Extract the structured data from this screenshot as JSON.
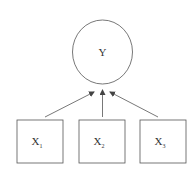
{
  "diagram": {
    "type": "path-diagram",
    "outcome": {
      "id": "Y",
      "label": "Y",
      "shape": "circle"
    },
    "predictors": [
      {
        "id": "X1",
        "label": "X",
        "subscript": "1",
        "shape": "square"
      },
      {
        "id": "X2",
        "label": "X",
        "subscript": "2",
        "shape": "square"
      },
      {
        "id": "X3",
        "label": "X",
        "subscript": "3",
        "shape": "square"
      }
    ],
    "edges": [
      {
        "from": "X1",
        "to": "Y"
      },
      {
        "from": "X2",
        "to": "Y"
      },
      {
        "from": "X3",
        "to": "Y"
      }
    ],
    "colors": {
      "stroke": "#555555",
      "text": "#333333",
      "background": "#ffffff"
    }
  }
}
